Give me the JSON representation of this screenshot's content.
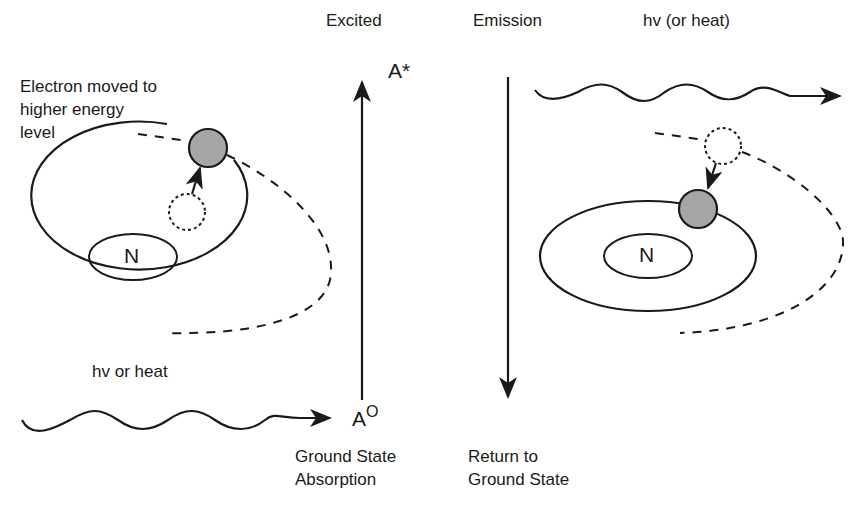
{
  "header": {
    "excited": "Excited",
    "emission": "Emission",
    "hv_or_heat_right": "hv (or heat)"
  },
  "left": {
    "electron_label_1": "Electron moved to",
    "electron_label_2": "higher energy",
    "electron_label_3": "level",
    "nucleus": "N",
    "hv_or_heat": "hv or heat"
  },
  "center": {
    "excited_state": "A*",
    "ground_state_symbol": "A",
    "ground_state_super": "O",
    "ground_label_1": "Ground State",
    "ground_label_2": "Absorption",
    "return_label_1": "Return to",
    "return_label_2": "Ground State"
  },
  "right": {
    "nucleus": "N"
  },
  "colors": {
    "stroke": "#1a1a1a",
    "electron_fill": "#a6a6a6",
    "background": "#ffffff"
  }
}
